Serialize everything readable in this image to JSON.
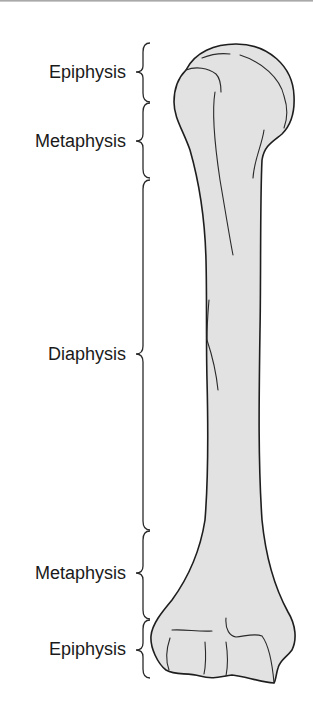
{
  "figure": {
    "colors": {
      "bone_fill": "#e2e2e2",
      "outline": "#1e1e1e",
      "text": "#1a1a1a",
      "background": "#ffffff"
    }
  },
  "labels": [
    {
      "text": "Epiphysis",
      "region": "proximal",
      "brace_top": 43,
      "brace_bottom": 102
    },
    {
      "text": "Metaphysis",
      "region": "proximal",
      "brace_top": 102,
      "brace_bottom": 178
    },
    {
      "text": "Diaphysis",
      "region": "shaft",
      "brace_top": 180,
      "brace_bottom": 530
    },
    {
      "text": "Metaphysis",
      "region": "distal",
      "brace_top": 530,
      "brace_bottom": 619
    },
    {
      "text": "Epiphysis",
      "region": "distal",
      "brace_top": 619,
      "brace_bottom": 678
    }
  ]
}
